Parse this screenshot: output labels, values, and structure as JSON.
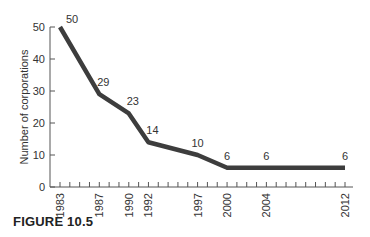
{
  "caption": "FIGURE 10.5",
  "chart_data": {
    "type": "line",
    "title": "",
    "xlabel": "",
    "ylabel": "Number of corporations",
    "x": [
      1983,
      1987,
      1990,
      1992,
      1997,
      2000,
      2004,
      2012
    ],
    "values": [
      50,
      29,
      23,
      14,
      10,
      6,
      6,
      6
    ],
    "data_labels": [
      "50",
      "29",
      "23",
      "14",
      "10",
      "6",
      "6",
      "6"
    ],
    "xticks_labeled": [
      "1983",
      "1987",
      "1990",
      "1992",
      "1997",
      "2000",
      "2004",
      "2012"
    ],
    "yticks": [
      0,
      10,
      20,
      30,
      40,
      50
    ],
    "ylim": [
      0,
      50
    ],
    "xlim": [
      1983,
      2012
    ],
    "minor_xticks_every": 1,
    "grid": false,
    "legend": null,
    "line_color": "#3d3d3d"
  }
}
